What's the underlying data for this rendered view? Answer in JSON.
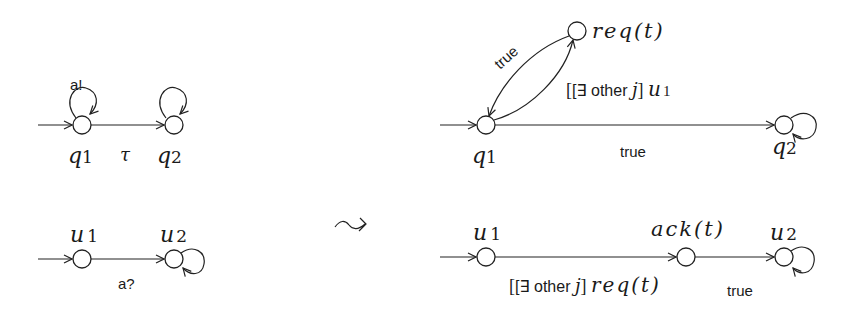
{
  "left_automata": {
    "process_q": {
      "states": [
        "q1",
        "q2"
      ],
      "state_labels": {
        "q1_base": "q",
        "q1_sub": "1",
        "q2_base": "q",
        "q2_sub": "2"
      },
      "self_loop_label": "a!",
      "transition_label": "τ"
    },
    "process_u": {
      "state_labels": {
        "u1_base": "u",
        "u1_sub": "1",
        "u2_base": "u",
        "u2_sub": "2"
      },
      "transition_label": "a?"
    }
  },
  "transform_symbol": "⤳",
  "right_automata": {
    "process_q": {
      "state_labels": {
        "q1_base": "q",
        "q1_sub": "1",
        "q2_base": "q",
        "q2_sub": "2",
        "req": "req(t)"
      },
      "edge_labels": {
        "req_to_q1": "true",
        "q1_to_req_prefix": "[∃ other ",
        "q1_to_req_var": "j",
        "q1_to_req_close": "] ",
        "q1_to_req_u": "u",
        "q1_to_req_sub": "1",
        "q1_to_q2": "true"
      }
    },
    "process_u": {
      "state_labels": {
        "u1_base": "u",
        "u1_sub": "1",
        "ack": "ack(t)",
        "u2_base": "u",
        "u2_sub": "2"
      },
      "edge_labels": {
        "u1_to_ack_prefix": "[∃ other ",
        "u1_to_ack_var": "j",
        "u1_to_ack_close": "] ",
        "u1_to_ack_req": "req(t)",
        "ack_to_u2": "true"
      }
    }
  }
}
